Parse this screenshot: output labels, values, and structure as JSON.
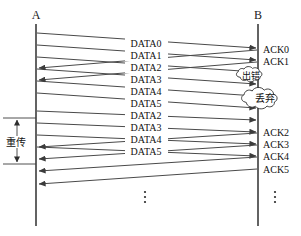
{
  "diagram": {
    "hosts": [
      {
        "id": "A",
        "label": "A",
        "x": 36,
        "role": "sender"
      },
      {
        "id": "B",
        "label": "B",
        "x": 258,
        "role": "receiver"
      }
    ],
    "data_messages": [
      {
        "label": "DATA0",
        "from": "A",
        "to": "B",
        "y_start": 33,
        "y_end": 48,
        "label_y": 45
      },
      {
        "label": "DATA1",
        "from": "A",
        "to": "B",
        "y_start": 45,
        "y_end": 60,
        "label_y": 57
      },
      {
        "label": "DATA2",
        "from": "A",
        "to": "B",
        "y_start": 57,
        "y_end": 72,
        "label_y": 69
      },
      {
        "label": "DATA3",
        "from": "A",
        "to": "B",
        "y_start": 69,
        "y_end": 84,
        "label_y": 81
      },
      {
        "label": "DATA4",
        "from": "A",
        "to": "B",
        "y_start": 81,
        "y_end": 96,
        "label_y": 93
      },
      {
        "label": "DATA5",
        "from": "A",
        "to": "B",
        "y_start": 93,
        "y_end": 108,
        "label_y": 105
      },
      {
        "label": "DATA2",
        "from": "A",
        "to": "B",
        "y_start": 111,
        "y_end": 120,
        "label_y": 117
      },
      {
        "label": "DATA3",
        "from": "A",
        "to": "B",
        "y_start": 123,
        "y_end": 132,
        "label_y": 129
      },
      {
        "label": "DATA4",
        "from": "A",
        "to": "B",
        "y_start": 135,
        "y_end": 144,
        "label_y": 141
      },
      {
        "label": "DATA5",
        "from": "A",
        "to": "B",
        "y_start": 147,
        "y_end": 156,
        "label_y": 153
      }
    ],
    "ack_messages": [
      {
        "label": "ACK0",
        "from": "B",
        "to": "A",
        "y_start": 50,
        "y_end": 68,
        "label_y": 52
      },
      {
        "label": "ACK1",
        "from": "B",
        "to": "A",
        "y_start": 62,
        "y_end": 80,
        "label_y": 64
      },
      {
        "label": "ACK2",
        "from": "B",
        "to": "A",
        "y_start": 133,
        "y_end": 147,
        "label_y": 135
      },
      {
        "label": "ACK3",
        "from": "B",
        "to": "A",
        "y_start": 145,
        "y_end": 159,
        "label_y": 147
      },
      {
        "label": "ACK4",
        "from": "B",
        "to": "A",
        "y_start": 157,
        "y_end": 171,
        "label_y": 159
      },
      {
        "label": "ACK5",
        "from": "B",
        "to": "A",
        "y_start": 169,
        "y_end": 184,
        "label_y": 171
      }
    ],
    "annotations": [
      {
        "id": "error-cloud",
        "label": "出错",
        "cx": 251,
        "cy": 76,
        "rx": 17,
        "ry": 8
      },
      {
        "id": "discard-cloud",
        "label": "丢弃",
        "cx": 266,
        "cy": 100,
        "rx": 24,
        "ry": 12
      }
    ],
    "bracket": {
      "label": "重传",
      "label_x": 16,
      "label_y": 144,
      "arrow_x": 17,
      "top_y": 118,
      "bottom_y": 164,
      "tick_x1": 3,
      "tick_x2": 36
    },
    "continuation": [
      {
        "id": "dots-a",
        "x": 145,
        "y": 196
      },
      {
        "id": "dots-b",
        "x": 275,
        "y": 196
      }
    ],
    "colors": {
      "line": "#4a4a4a",
      "lifeline": "#3c3c3c",
      "text": "#111111",
      "background": "#ffffff"
    }
  }
}
